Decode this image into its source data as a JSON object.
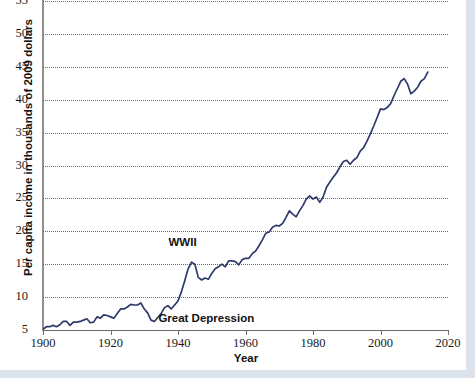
{
  "chart_data": {
    "type": "line",
    "title": "",
    "subtitle": "",
    "xlabel": "Year",
    "ylabel": "Per capita income in thousands of 2009 dollars",
    "xlim": [
      1900,
      2020
    ],
    "ylim": [
      5,
      55
    ],
    "xticks": [
      1900,
      1920,
      1940,
      1960,
      1980,
      2000,
      2020
    ],
    "yticks": [
      5,
      10,
      15,
      20,
      25,
      30,
      35,
      40,
      45,
      50,
      55
    ],
    "grid": "horizontal-dotted",
    "legend": "none",
    "line_color": "#2e3a6b",
    "annotations": [
      {
        "text": "WWII",
        "x": 1944,
        "y": 18.2
      },
      {
        "text": "Great Depression",
        "x": 1933,
        "y": 6.6
      }
    ],
    "series": [
      {
        "name": "Per capita income",
        "x": [
          1900,
          1901,
          1902,
          1903,
          1904,
          1905,
          1906,
          1907,
          1908,
          1909,
          1910,
          1911,
          1912,
          1913,
          1914,
          1915,
          1916,
          1917,
          1918,
          1919,
          1920,
          1921,
          1922,
          1923,
          1924,
          1925,
          1926,
          1927,
          1928,
          1929,
          1930,
          1931,
          1932,
          1933,
          1934,
          1935,
          1936,
          1937,
          1938,
          1939,
          1940,
          1941,
          1942,
          1943,
          1944,
          1945,
          1946,
          1947,
          1948,
          1949,
          1950,
          1951,
          1952,
          1953,
          1954,
          1955,
          1956,
          1957,
          1958,
          1959,
          1960,
          1961,
          1962,
          1963,
          1964,
          1965,
          1966,
          1967,
          1968,
          1969,
          1970,
          1971,
          1972,
          1973,
          1974,
          1975,
          1976,
          1977,
          1978,
          1979,
          1980,
          1981,
          1982,
          1983,
          1984,
          1985,
          1986,
          1987,
          1988,
          1989,
          1990,
          1991,
          1992,
          1993,
          1994,
          1995,
          1996,
          1997,
          1998,
          1999,
          2000,
          2001,
          2002,
          2003,
          2004,
          2005,
          2006,
          2007,
          2008,
          2009,
          2010,
          2011,
          2012,
          2013,
          2014
        ],
        "values": [
          5.1,
          5.5,
          5.5,
          5.7,
          5.5,
          5.8,
          6.3,
          6.3,
          5.7,
          6.2,
          6.2,
          6.3,
          6.5,
          6.7,
          6.1,
          6.2,
          7.0,
          6.8,
          7.3,
          7.2,
          7.0,
          6.8,
          7.5,
          8.2,
          8.2,
          8.5,
          8.9,
          8.8,
          8.8,
          9.1,
          8.2,
          7.6,
          6.5,
          6.3,
          6.9,
          7.5,
          8.4,
          8.7,
          8.2,
          8.8,
          9.4,
          10.8,
          12.5,
          14.3,
          15.3,
          15.0,
          13.0,
          12.6,
          12.9,
          12.7,
          13.6,
          14.3,
          14.6,
          15.0,
          14.6,
          15.5,
          15.5,
          15.4,
          14.9,
          15.7,
          15.9,
          15.9,
          16.6,
          17.0,
          17.8,
          18.7,
          19.7,
          19.9,
          20.6,
          20.9,
          20.8,
          21.2,
          22.1,
          23.1,
          22.6,
          22.2,
          23.1,
          23.9,
          24.9,
          25.4,
          24.9,
          25.2,
          24.4,
          25.2,
          26.7,
          27.5,
          28.2,
          28.9,
          29.8,
          30.6,
          30.8,
          30.2,
          30.8,
          31.2,
          32.2,
          32.7,
          33.7,
          34.8,
          36.0,
          37.3,
          38.6,
          38.5,
          38.8,
          39.4,
          40.6,
          41.7,
          42.8,
          43.2,
          42.4,
          40.9,
          41.3,
          41.9,
          42.8,
          43.2,
          44.2
        ]
      }
    ]
  },
  "axis": {
    "ylabel": "Per capita income in thousands of 2009 dollars",
    "xlabel": "Year",
    "yticks": [
      "55",
      "50",
      "45",
      "40",
      "35",
      "30",
      "25",
      "20",
      "15",
      "10",
      "5"
    ],
    "xticks": [
      "1900",
      "1920",
      "1940",
      "1960",
      "1980",
      "2000",
      "2020"
    ]
  },
  "annotations": {
    "wwii": "WWII",
    "great_depression": "Great Depression"
  },
  "colors": {
    "line": "#2e3a6b",
    "grid": "#6a6a6a",
    "axis": "#6f6f6f",
    "page_background": "#dbe2ea",
    "card_background": "#ffffff"
  }
}
